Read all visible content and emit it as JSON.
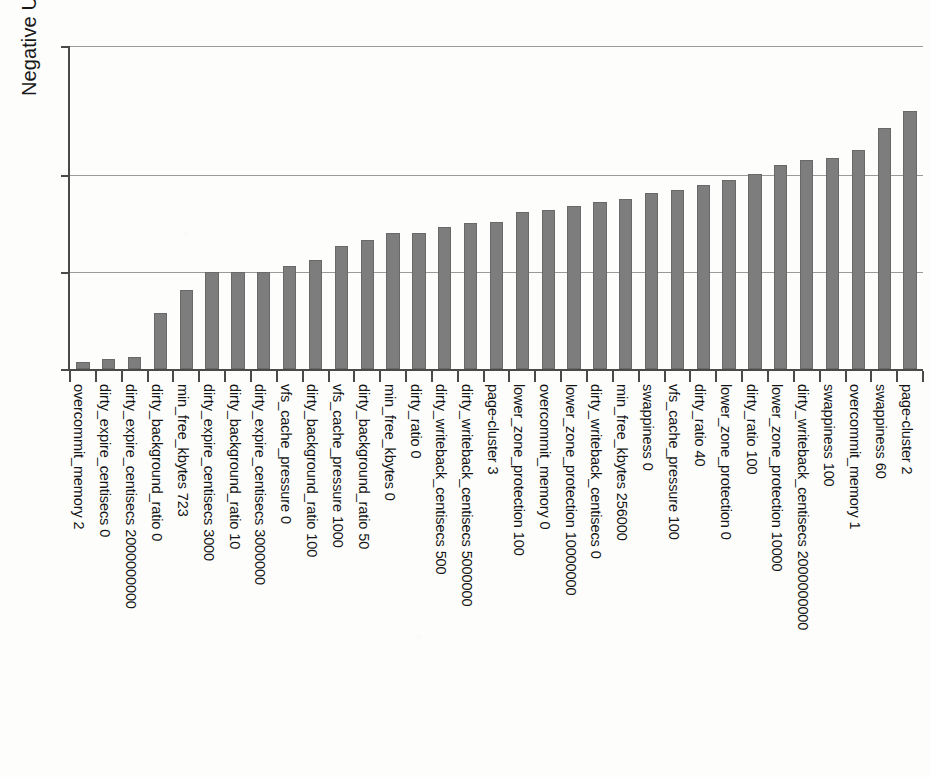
{
  "chart_data": {
    "type": "bar",
    "title": "",
    "subtitle": "",
    "xlabel": "",
    "ylabel": "Negative Undefined Positive",
    "orientation": "vertical",
    "grid": true,
    "legend": false,
    "legend_position": "none",
    "bar_color": "#7d7d7d",
    "axis_color": "#4a4a4a",
    "gridline_color": "#9a9a9a",
    "ylim": [
      0,
      1.0
    ],
    "ytick_labels": [],
    "ytick_values": [
      0.0,
      0.3,
      0.6,
      1.0
    ],
    "categories": [
      "overcommit_memory 2",
      "dirty_expire_centisecs 0",
      "dirty_expire_centisecs 2000000000",
      "dirty_background_ratio 0",
      "min_free_kbytes 723",
      "dirty_expire_centisecs 3000",
      "dirty_background_ratio 10",
      "dirty_expire_centisecs 3000000",
      "vfs_cache_pressure 0",
      "dirty_background_ratio 100",
      "vfs_cache_pressure 1000",
      "dirty_background_ratio 50",
      "min_free_kbytes 0",
      "dirty_ratio 0",
      "dirty_writeback_centisecs 500",
      "dirty_writeback_centisecs 5000000",
      "page-cluster 3",
      "lower_zone_protection 100",
      "overcommit_memory 0",
      "lower_zone_protection 10000000",
      "dirty_writeback_centisecs 0",
      "min_free_kbytes 256000",
      "swappiness 0",
      "vfs_cache_pressure 100",
      "dirty_ratio 40",
      "lower_zone_protection 0",
      "dirty_ratio 100",
      "lower_zone_protection 10000",
      "dirty_writeback_centisecs 2000000000",
      "swappiness 100",
      "overcommit_memory 1",
      "swappiness 60",
      "page-cluster 2"
    ],
    "values": [
      0.022,
      0.032,
      0.036,
      0.175,
      0.245,
      0.3,
      0.3,
      0.302,
      0.318,
      0.338,
      0.382,
      0.398,
      0.422,
      0.422,
      0.44,
      0.452,
      0.455,
      0.485,
      0.492,
      0.505,
      0.518,
      0.528,
      0.545,
      0.553,
      0.57,
      0.585,
      0.605,
      0.632,
      0.648,
      0.652,
      0.678,
      0.745,
      0.8
    ]
  },
  "axis": {
    "ylabel": "Negative Undefined Positive"
  }
}
